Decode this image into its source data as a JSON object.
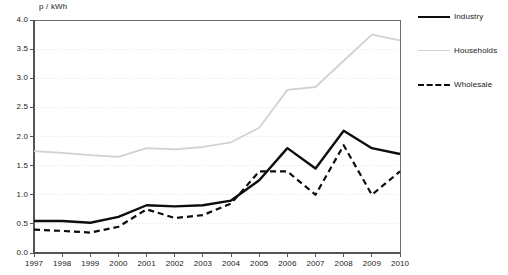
{
  "chart_data": {
    "type": "line",
    "title": "",
    "ylabel": "p / kWh",
    "xlabel": "",
    "ylim": [
      0.0,
      4.0
    ],
    "yticks": [
      "0.0",
      "0.5",
      "1.0",
      "1.5",
      "2.0",
      "2.5",
      "3.0",
      "3.5",
      "4.0"
    ],
    "grid": true,
    "grid_style": "dotted-horizontal",
    "legend_position": "right",
    "categories": [
      1997,
      1998,
      1999,
      2000,
      2001,
      2002,
      2003,
      2004,
      2005,
      2006,
      2007,
      2008,
      2009,
      2010
    ],
    "xtick_labels": [
      "1997",
      "1998",
      "1999",
      "2000",
      "2001",
      "2002",
      "2003",
      "2004",
      "2005",
      "2006",
      "2007",
      "2008",
      "2009",
      "2010"
    ],
    "series": [
      {
        "name": "Industry",
        "color": "#0d0d0d",
        "style": "solid",
        "width": 2.4,
        "values": [
          0.55,
          0.55,
          0.52,
          0.62,
          0.82,
          0.8,
          0.82,
          0.9,
          1.25,
          1.8,
          1.45,
          2.1,
          1.8,
          1.7
        ]
      },
      {
        "name": "Households",
        "color": "#d2d2d2",
        "style": "solid",
        "width": 1.8,
        "values": [
          1.75,
          1.72,
          1.68,
          1.65,
          1.8,
          1.78,
          1.82,
          1.9,
          2.15,
          2.8,
          2.85,
          3.3,
          3.75,
          3.65
        ]
      },
      {
        "name": "Wholesale",
        "color": "#0d0d0d",
        "style": "dashed",
        "width": 2.2,
        "values": [
          0.4,
          0.38,
          0.35,
          0.45,
          0.75,
          0.6,
          0.65,
          0.85,
          1.4,
          1.4,
          1.0,
          1.85,
          1.0,
          1.4
        ]
      }
    ]
  },
  "legend": {
    "items": [
      {
        "label": "Industry"
      },
      {
        "label": "Households"
      },
      {
        "label": "Wholesale"
      }
    ]
  }
}
